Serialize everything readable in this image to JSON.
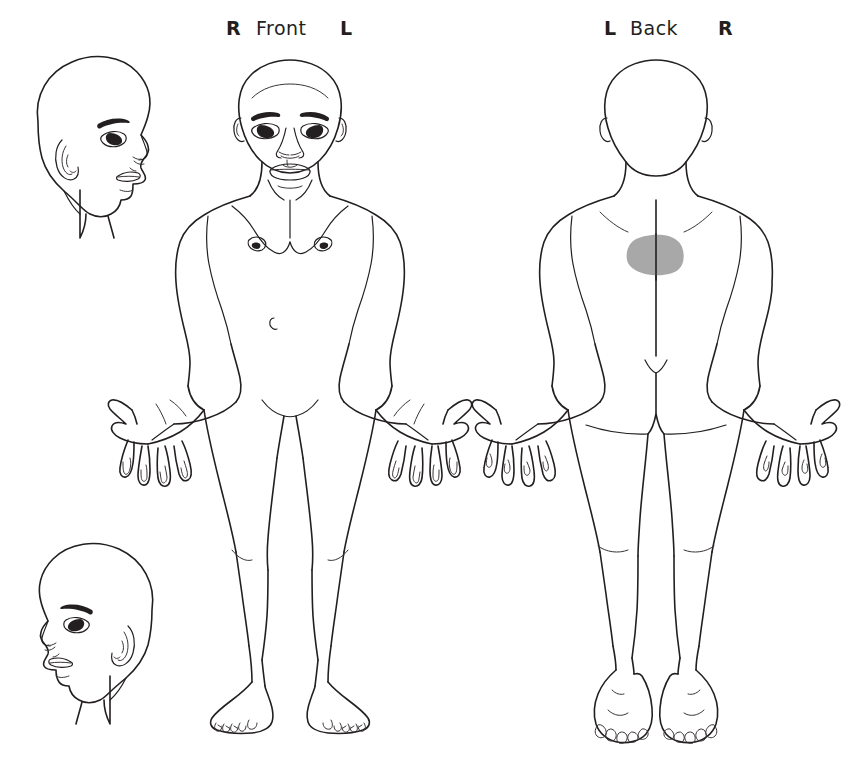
{
  "diagram": {
    "background_color": "#ffffff",
    "ink_color": "#231f20",
    "shading_color": "#a8a8a8"
  },
  "front_panel": {
    "left_marker": "R",
    "view_label": "Front",
    "right_marker": "L"
  },
  "back_panel": {
    "left_marker": "L",
    "view_label": "Back",
    "right_marker": "R"
  },
  "figures": [
    {
      "name": "head-profile-right-facing",
      "position": "top-left"
    },
    {
      "name": "head-profile-left-facing",
      "position": "bottom-left"
    },
    {
      "name": "body-front-view",
      "position": "center"
    },
    {
      "name": "body-back-view",
      "position": "right"
    }
  ],
  "markings": [
    {
      "id": "pain-region-1",
      "region": "upper back / thoracic",
      "figure": "body-back-view",
      "shape": "filled blob",
      "color": "#a8a8a8"
    }
  ]
}
